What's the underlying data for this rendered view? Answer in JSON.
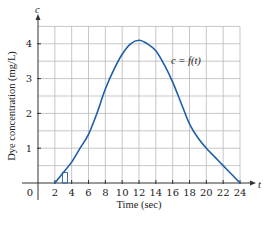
{
  "chart_data": {
    "type": "line",
    "title": "",
    "xlabel": "Time (sec)",
    "ylabel": "Dye concentration (mg/L)",
    "x_axis_var": "t",
    "y_axis_var": "c",
    "curve_label": "c = f(t)",
    "origin_label": "0",
    "xlim": [
      0,
      24
    ],
    "ylim": [
      0,
      4.5
    ],
    "x_ticks": [
      2,
      4,
      6,
      8,
      10,
      12,
      14,
      16,
      18,
      20,
      22,
      24
    ],
    "x_tick_labels": [
      "2",
      "4",
      "6",
      "8",
      "10",
      "12",
      "14",
      "16",
      "18",
      "20",
      "22",
      "24"
    ],
    "y_ticks": [
      1,
      2,
      3,
      4
    ],
    "y_tick_labels": [
      "1",
      "2",
      "3",
      "4"
    ],
    "grid": true,
    "grid_x_step": 2,
    "grid_y_step": 0.5,
    "series": [
      {
        "name": "c = f(t)",
        "color": "#1f5fa8",
        "x": [
          2,
          3,
          4,
          5,
          6,
          7,
          8,
          9,
          10,
          11,
          12,
          13,
          14,
          15,
          16,
          17,
          18,
          19,
          20,
          21,
          22,
          23,
          24
        ],
        "values": [
          0,
          0.3,
          0.6,
          1.0,
          1.4,
          2.0,
          2.7,
          3.25,
          3.7,
          4.0,
          4.1,
          4.0,
          3.8,
          3.4,
          2.9,
          2.3,
          1.7,
          1.3,
          1.0,
          0.75,
          0.5,
          0.25,
          0
        ]
      }
    ],
    "annotations": [
      {
        "type": "rectangle-marker",
        "x_from": 2.9,
        "x_to": 3.5,
        "height": 0.3,
        "note": "small sample bar under curve near t=3"
      }
    ],
    "legend": "inline label near curve at upper right"
  }
}
